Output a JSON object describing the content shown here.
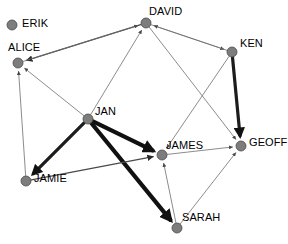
{
  "diagram": {
    "type": "directed-social-network-graph",
    "title": "",
    "node_color": "#7d7d7d",
    "edge_color_light": "#6e6e6e",
    "edge_color_dark": "#111111",
    "background": "#ffffff",
    "node_radius": 5
  },
  "nodes": [
    {
      "id": "erik",
      "label": "ERIK",
      "x": 12,
      "y": 25,
      "label_x": 22,
      "label_y": 18,
      "isolated": true
    },
    {
      "id": "alice",
      "label": "ALICE",
      "x": 18,
      "y": 63,
      "label_x": 8,
      "label_y": 42,
      "isolated": false
    },
    {
      "id": "david",
      "label": "DAVID",
      "x": 146,
      "y": 23,
      "label_x": 149,
      "label_y": 6,
      "isolated": false
    },
    {
      "id": "ken",
      "label": "KEN",
      "x": 232,
      "y": 52,
      "label_x": 240,
      "label_y": 38,
      "isolated": false
    },
    {
      "id": "jan",
      "label": "JAN",
      "x": 88,
      "y": 119,
      "label_x": 95,
      "label_y": 106,
      "isolated": false
    },
    {
      "id": "james",
      "label": "JAMES",
      "x": 162,
      "y": 155,
      "label_x": 166,
      "label_y": 140,
      "isolated": false
    },
    {
      "id": "geoff",
      "label": "GEOFF",
      "x": 241,
      "y": 146,
      "label_x": 249,
      "label_y": 137,
      "isolated": false
    },
    {
      "id": "sarah",
      "label": "SARAH",
      "x": 177,
      "y": 228,
      "label_x": 182,
      "label_y": 212,
      "isolated": false
    },
    {
      "id": "jamie",
      "label": "JAMIE",
      "x": 26,
      "y": 181,
      "label_x": 34,
      "label_y": 173,
      "isolated": false
    }
  ],
  "edges": [
    {
      "from": "david",
      "to": "alice",
      "weight": "medium",
      "arrow": true
    },
    {
      "from": "alice",
      "to": "david",
      "weight": "thin",
      "arrow": true
    },
    {
      "from": "david",
      "to": "ken",
      "weight": "thin",
      "arrow": true
    },
    {
      "from": "ken",
      "to": "david",
      "weight": "thin",
      "arrow": true
    },
    {
      "from": "jan",
      "to": "david",
      "weight": "thin",
      "arrow": true
    },
    {
      "from": "jan",
      "to": "alice",
      "weight": "thin",
      "arrow": true
    },
    {
      "from": "jamie",
      "to": "alice",
      "weight": "thin",
      "arrow": true
    },
    {
      "from": "david",
      "to": "geoff",
      "weight": "thin",
      "arrow": true
    },
    {
      "from": "ken",
      "to": "james",
      "weight": "thin",
      "arrow": true
    },
    {
      "from": "james",
      "to": "geoff",
      "weight": "thin",
      "arrow": true
    },
    {
      "from": "sarah",
      "to": "james",
      "weight": "thin",
      "arrow": true
    },
    {
      "from": "sarah",
      "to": "geoff",
      "weight": "thin",
      "arrow": true
    },
    {
      "from": "ken",
      "to": "geoff",
      "weight": "thick",
      "arrow": true
    },
    {
      "from": "jan",
      "to": "jamie",
      "weight": "thick",
      "arrow": true
    },
    {
      "from": "jan",
      "to": "james",
      "weight": "xthick",
      "arrow": true
    },
    {
      "from": "jan",
      "to": "sarah",
      "weight": "xthick",
      "arrow": true
    },
    {
      "from": "jamie",
      "to": "james",
      "weight": "medium",
      "arrow": true
    }
  ]
}
